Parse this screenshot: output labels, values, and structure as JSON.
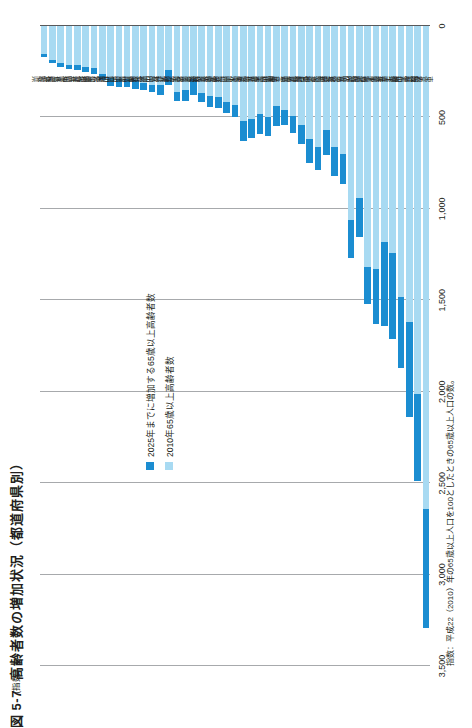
{
  "figure": {
    "number": "図 5-7",
    "title": "高齢者数の増加状況（都道府県別）",
    "unit_label": "(指数)",
    "footnote": "指数：平成22（2010）年の65歳以上人口を100としたときの65歳以上人口の数。"
  },
  "legend": {
    "position": "inside-upper-left",
    "items": [
      {
        "label": "2025年までに増加する65歳以上高齢者数",
        "color": "#1b8dd1",
        "key": "increase"
      },
      {
        "label": "2010年65歳以上高齢者数",
        "color": "#a8daf2",
        "key": "base"
      }
    ]
  },
  "axis": {
    "value_ticks": [
      "0",
      "500",
      "1,000",
      "1,500",
      "2,000",
      "2,500",
      "3,000",
      "3,500"
    ],
    "value_min": 0,
    "value_max": 3500,
    "orientation": "horizontal-bars-rotated"
  },
  "chart_data": {
    "type": "bar",
    "title": "高齢者数の増加状況（都道府県別）",
    "xlabel": "",
    "ylabel": "(指数)",
    "ylim": [
      0,
      3500
    ],
    "grid": true,
    "stacked": true,
    "legend_position": "inside-upper-left",
    "categories": [
      "鳥取県",
      "島根県",
      "徳島県",
      "高知県",
      "福井県",
      "山梨県",
      "佐賀県",
      "和歌山県",
      "石川県",
      "富山県",
      "香川県",
      "宮崎県",
      "山形県",
      "秋田県",
      "大分県",
      "沖縄県",
      "岩手県",
      "奈良県",
      "滋賀県",
      "青森県",
      "愛媛県",
      "長崎県",
      "山口県",
      "熊本県",
      "岐阜県",
      "群馬県",
      "栃木県",
      "岡山県",
      "三重県",
      "鹿児島県",
      "福島県",
      "宮城県",
      "京都府",
      "新潟県",
      "長野県",
      "茨城県",
      "広島県",
      "福岡県",
      "静岡県",
      "北海道",
      "兵庫県",
      "千葉県",
      "埼玉県",
      "愛知県",
      "神奈川県",
      "大阪府",
      "東京都"
    ],
    "series": [
      {
        "name": "2010年65歳以上高齢者数",
        "color": "#a8daf2",
        "values": [
          155,
          185,
          205,
          215,
          215,
          225,
          230,
          265,
          285,
          290,
          290,
          295,
          310,
          320,
          325,
          240,
          360,
          350,
          290,
          365,
          385,
          390,
          415,
          430,
          520,
          510,
          480,
          500,
          440,
          460,
          490,
          540,
          620,
          660,
          570,
          660,
          700,
          1060,
          940,
          1320,
          1330,
          1180,
          1240,
          1480,
          1620,
          2010,
          2640
        ]
      },
      {
        "name": "2025年までに増加する65歳以上高齢者数",
        "color": "#1b8dd1",
        "values": [
          15,
          18,
          20,
          20,
          25,
          28,
          30,
          32,
          42,
          45,
          46,
          48,
          42,
          40,
          55,
          85,
          52,
          62,
          85,
          52,
          58,
          60,
          62,
          70,
          110,
          105,
          112,
          100,
          105,
          80,
          95,
          105,
          130,
          125,
          135,
          160,
          165,
          210,
          215,
          200,
          300,
          460,
          470,
          390,
          520,
          480,
          650
        ]
      }
    ],
    "note": "値は指数（平成22(2010)年の65歳以上人口=100基準、千人単位の図示）"
  }
}
